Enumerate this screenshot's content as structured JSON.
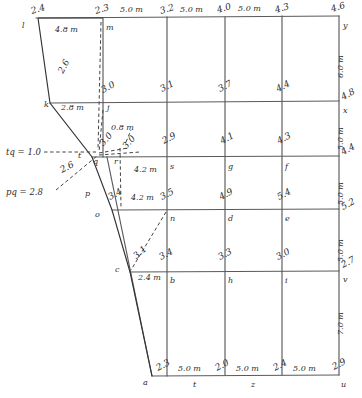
{
  "figure": {
    "type": "survey-grid-diagram",
    "ink_color": "#333333",
    "grid_color": "#5a5a5a",
    "dashed_color": "#444444"
  },
  "top_edge": {
    "dims": [
      "5.0 m",
      "5.0 m",
      "5.0 m"
    ],
    "values": [
      "2.4",
      "2.3",
      "3.2",
      "4.0",
      "4.3",
      "4.6"
    ]
  },
  "bottom_edge": {
    "dims": [
      "5.0 m",
      "5.0 m",
      "5.0 m"
    ],
    "values": [
      "2.3",
      "2.0",
      "2.4",
      "2.9"
    ],
    "points": [
      "a",
      "t",
      "z",
      "u"
    ]
  },
  "right_edge": {
    "dims": [
      "6.0 m",
      "5.0 m",
      "5.0 m",
      "5.0 m",
      "7.0 m"
    ],
    "values": [
      "4.6",
      "4.8",
      "4.4",
      "5.2",
      "2.7",
      "2.9"
    ],
    "points": [
      "y",
      "x",
      "v",
      "u"
    ]
  },
  "interior": {
    "row1": {
      "values": [
        "3.0",
        "3.1",
        "3.7",
        "4.4"
      ],
      "points": [
        "j"
      ]
    },
    "row2": {
      "values": [
        "2.9",
        "4.1",
        "4.3"
      ],
      "points": [
        "s",
        "g",
        "f"
      ]
    },
    "row3": {
      "values": [
        "3.5",
        "4.9",
        "5.4"
      ],
      "points": [
        "n",
        "d",
        "e"
      ]
    },
    "row4": {
      "values": [
        "3.4",
        "3.3",
        "3.0"
      ],
      "points": [
        "b",
        "h",
        "i"
      ]
    }
  },
  "left_boundary": {
    "points": [
      "l",
      "k",
      "t",
      "q",
      "p",
      "o",
      "c",
      "a"
    ],
    "top_point": "l",
    "bottom_point": "a"
  },
  "dimensions": {
    "lm": "4.8 m",
    "kj": "2.8 m",
    "qr": "0.8 m",
    "rs": "4.2 m",
    "on": "4.2 m",
    "cb": "2.4 m"
  },
  "annotations": {
    "tq": "tq = 1.0",
    "pq": "pq = 2.8",
    "lk_value": "2.6",
    "tq_value": "2.6",
    "pq_value": "2.6",
    "q_value": "3.0",
    "r_value": "3.0",
    "r2_value": "3.0",
    "o_value": "3.4",
    "n_value": "3.5",
    "c_value": "3.1"
  },
  "node_labels": {
    "m": "m",
    "j": "j",
    "k": "k",
    "l": "l",
    "t": "t",
    "q": "q",
    "r": "r",
    "p": "p",
    "o": "o",
    "n": "n",
    "c": "c",
    "b": "b",
    "a": "a",
    "s": "s",
    "g": "g",
    "f": "f",
    "d": "d",
    "e": "e",
    "h": "h",
    "i": "i",
    "y": "y",
    "x": "x",
    "v": "v",
    "u": "u",
    "t_bottom": "t",
    "z": "z"
  }
}
